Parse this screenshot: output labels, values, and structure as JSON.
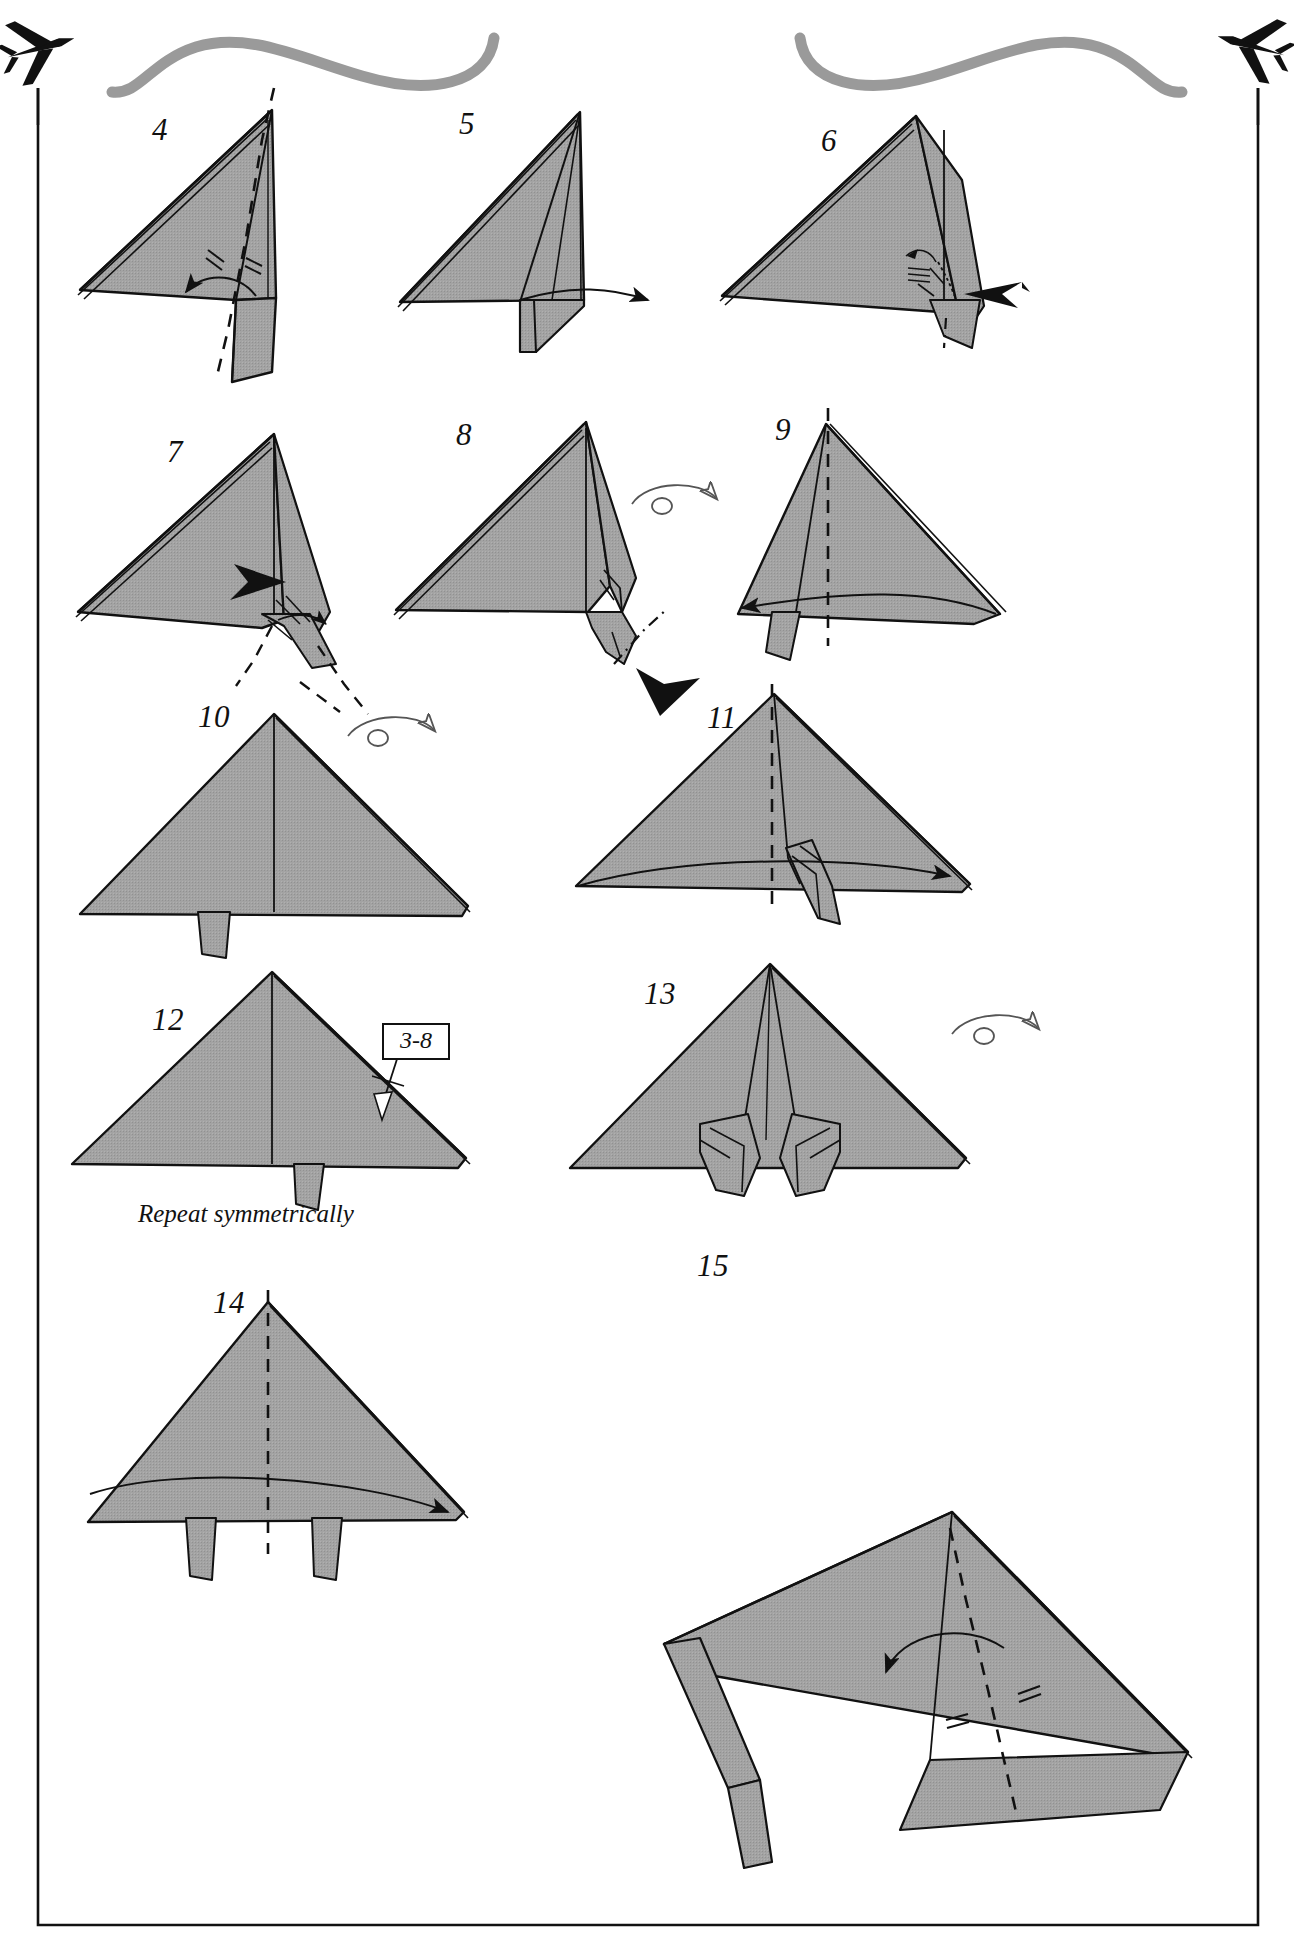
{
  "page": {
    "kind": "origami-instruction-diagram",
    "width": 1294,
    "height": 1940,
    "background_color": "#ffffff",
    "paper_fill_color": "#a0a0a0",
    "paper_fill_color_light": "#b4b4b4",
    "line_color": "#111111",
    "header_ribbon_color": "#9a9a9a",
    "frame_color": "#111111"
  },
  "header": {
    "left_icon": "airplane-icon",
    "right_icon": "airplane-icon",
    "ribbon_left": "swoosh-ribbon-left",
    "ribbon_right": "swoosh-ribbon-right"
  },
  "steps": [
    {
      "id": "4",
      "number": "4",
      "label_x": 152,
      "label_y": 112
    },
    {
      "id": "5",
      "number": "5",
      "label_x": 459,
      "label_y": 106
    },
    {
      "id": "6",
      "number": "6",
      "label_x": 821,
      "label_y": 123
    },
    {
      "id": "7",
      "number": "7",
      "label_x": 167,
      "label_y": 434
    },
    {
      "id": "8",
      "number": "8",
      "label_x": 456,
      "label_y": 417
    },
    {
      "id": "9",
      "number": "9",
      "label_x": 775,
      "label_y": 412
    },
    {
      "id": "10",
      "number": "10",
      "label_x": 198,
      "label_y": 699
    },
    {
      "id": "11",
      "number": "11",
      "label_x": 707,
      "label_y": 700
    },
    {
      "id": "12",
      "number": "12",
      "label_x": 152,
      "label_y": 1002
    },
    {
      "id": "13",
      "number": "13",
      "label_x": 644,
      "label_y": 976
    },
    {
      "id": "14",
      "number": "14",
      "label_x": 213,
      "label_y": 1285
    },
    {
      "id": "15",
      "number": "15",
      "label_x": 697,
      "label_y": 1248
    }
  ],
  "annotations": {
    "repeat_caption": "Repeat symmetrically",
    "repeat_caption_x": 138,
    "repeat_caption_y": 1200,
    "repeat_box_label": "3-8",
    "repeat_box_x": 382,
    "repeat_box_y": 1023
  },
  "symbols": {
    "valley_fold": "dashed-line",
    "mountain_fold": "dash-dot-line",
    "fold_arrow": "curved-arrow",
    "push_arrow": "solid-black-arrowhead",
    "turn_over": "turn-over-loop-arrow",
    "equal_marks": "equal-tick-marks",
    "repeat_marker": "repeat-crossbar"
  },
  "turn_over_symbols": [
    {
      "id": "turnover-step8",
      "x": 660,
      "y": 505
    },
    {
      "id": "turnover-step10",
      "x": 378,
      "y": 735
    },
    {
      "id": "turnover-step13",
      "x": 985,
      "y": 1033
    }
  ]
}
